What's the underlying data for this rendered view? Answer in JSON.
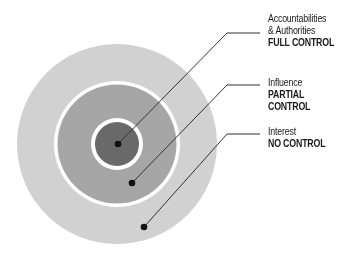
{
  "diagram": {
    "type": "concentric-circles",
    "rings": [
      {
        "name": "Accountabilities & Authorities",
        "title_lines": [
          "Accountabilities",
          "& Authorities"
        ],
        "control": "FULL CONTROL",
        "color": "#6e6e6e"
      },
      {
        "name": "Influence",
        "title_lines": [
          "Influence"
        ],
        "control": "PARTIAL CONTROL",
        "color": "#a9a9a9"
      },
      {
        "name": "Interest",
        "title_lines": [
          "Interest"
        ],
        "control": "NO CONTROL",
        "color": "#d6d6d6"
      }
    ]
  },
  "labels": {
    "inner": {
      "line1": "Accountabilities",
      "line2": "& Authorities",
      "control": "FULL CONTROL"
    },
    "middle": {
      "line1": "Influence",
      "control": "PARTIAL CONTROL"
    },
    "outer": {
      "line1": "Interest",
      "control": "NO CONTROL"
    }
  }
}
